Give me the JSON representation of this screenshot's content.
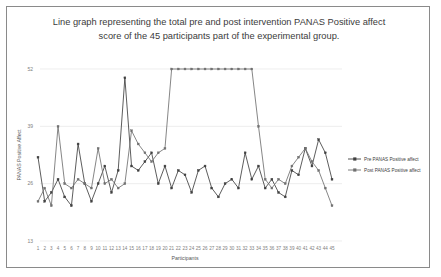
{
  "figure": {
    "title": "Line graph representing the total pre and post intervention PANAS Positive affect score of the 45 participants part of the experimental group."
  },
  "legend": {
    "position": "right",
    "items": [
      {
        "label": "Pre PANAS Positive affect",
        "color": "#404040"
      },
      {
        "label": "Post PANAS Positive affect",
        "color": "#808080"
      }
    ]
  },
  "axes": {
    "x_title": "Participants",
    "y_title": "PANAS Positive Affect",
    "y_ticks": [
      "52",
      "39",
      "26",
      "13"
    ],
    "x_ticks": [
      "1",
      "2",
      "3",
      "4",
      "5",
      "6",
      "7",
      "8",
      "9",
      "10",
      "11",
      "12",
      "13",
      "14",
      "15",
      "16",
      "17",
      "18",
      "19",
      "20",
      "21",
      "22",
      "23",
      "24",
      "25",
      "26",
      "27",
      "28",
      "29",
      "30",
      "31",
      "32",
      "33",
      "34",
      "35",
      "36",
      "37",
      "38",
      "39",
      "40",
      "41",
      "42",
      "43",
      "44",
      "45"
    ]
  },
  "chart_data": {
    "type": "line",
    "title": "Line graph representing the total pre and post intervention PANAS Positive affect score of the 45 participants part of the experimental group.",
    "xlabel": "Participants",
    "ylabel": "PANAS Positive Affect",
    "ylim": [
      13,
      52
    ],
    "xlim": [
      1,
      45
    ],
    "grid": true,
    "legend_position": "right",
    "x": [
      1,
      2,
      3,
      4,
      5,
      6,
      7,
      8,
      9,
      10,
      11,
      12,
      13,
      14,
      15,
      16,
      17,
      18,
      19,
      20,
      21,
      22,
      23,
      24,
      25,
      26,
      27,
      28,
      29,
      30,
      31,
      32,
      33,
      34,
      35,
      36,
      37,
      38,
      39,
      40,
      41,
      42,
      43,
      44,
      45
    ],
    "series": [
      {
        "name": "Pre PANAS Positive affect",
        "color": "#404040",
        "values": [
          32,
          22,
          24,
          27,
          23,
          21,
          35,
          26,
          22,
          26,
          30,
          24,
          29,
          50,
          30,
          29,
          31,
          33,
          26,
          30,
          25,
          29,
          28,
          24,
          29,
          30,
          25,
          23,
          26,
          27,
          25,
          33,
          27,
          30,
          25,
          27,
          24,
          23,
          29,
          28,
          34,
          30,
          36,
          33,
          27
        ]
      },
      {
        "name": "Post PANAS Positive affect",
        "color": "#707070",
        "values": [
          22,
          25,
          21,
          39,
          26,
          25,
          27,
          26,
          25,
          34,
          26,
          27,
          25,
          26,
          38,
          35,
          33,
          31,
          33,
          34,
          52,
          52,
          52,
          52,
          52,
          52,
          52,
          52,
          52,
          52,
          52,
          52,
          52,
          39,
          27,
          25,
          27,
          26,
          30,
          32,
          34,
          31,
          29,
          25,
          21
        ]
      }
    ]
  }
}
